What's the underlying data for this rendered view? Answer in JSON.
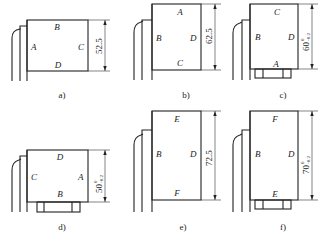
{
  "figures": [
    {
      "id": "a",
      "caption": "a)",
      "labels": {
        "top": "B",
        "left": "A",
        "right": "C",
        "bottom": "D"
      },
      "dimension": {
        "value": "52.5",
        "tolerance_upper": "",
        "tolerance_lower": ""
      },
      "has_base_block": false
    },
    {
      "id": "b",
      "caption": "b)",
      "labels": {
        "top": "A",
        "left": "B",
        "right": "D",
        "bottom": "C"
      },
      "dimension": {
        "value": "62.5",
        "tolerance_upper": "",
        "tolerance_lower": ""
      },
      "has_base_block": false
    },
    {
      "id": "c",
      "caption": "c)",
      "labels": {
        "top": "C",
        "left": "B",
        "right": "D",
        "bottom": "A"
      },
      "dimension": {
        "value": "60",
        "tolerance_upper": "0",
        "tolerance_lower": "-0.2"
      },
      "has_base_block": true
    },
    {
      "id": "d",
      "caption": "d)",
      "labels": {
        "top": "D",
        "left": "C",
        "right": "A",
        "bottom": "B"
      },
      "dimension": {
        "value": "50",
        "tolerance_upper": "0",
        "tolerance_lower": "-0.2"
      },
      "has_base_block": true
    },
    {
      "id": "e",
      "caption": "e)",
      "labels": {
        "top": "E",
        "left": "B",
        "right": "D",
        "bottom": "F"
      },
      "dimension": {
        "value": "72.5",
        "tolerance_upper": "",
        "tolerance_lower": ""
      },
      "has_base_block": false
    },
    {
      "id": "f",
      "caption": "f)",
      "labels": {
        "top": "F",
        "left": "B",
        "right": "D",
        "bottom": "E"
      },
      "dimension": {
        "value": "70",
        "tolerance_upper": "0",
        "tolerance_lower": "-0.2"
      },
      "has_base_block": true
    }
  ]
}
